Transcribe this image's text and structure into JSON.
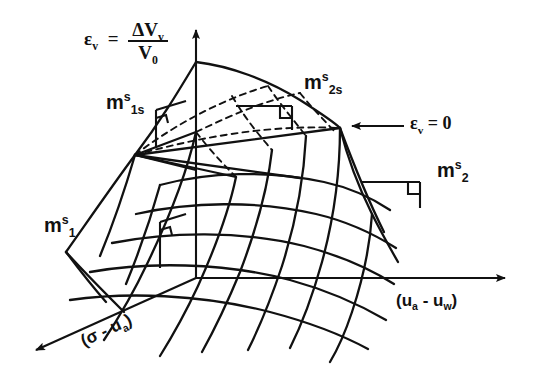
{
  "figure": {
    "type": "3d-surface-diagram",
    "background_color": "#ffffff",
    "line_color": "#111111"
  },
  "axes": {
    "vertical": {
      "name": "volumetric-strain-axis",
      "symbol": "ε",
      "symbol_sub": "v",
      "equals": "=",
      "numerator": "ΔV",
      "numerator_sub": "v",
      "denominator": "V",
      "denominator_sub": "0"
    },
    "horizontal": {
      "name": "matric-suction-axis",
      "label": "(u",
      "label_sub_a": "a",
      "label_minus": " - u",
      "label_sub_w": "w",
      "label_close": ")",
      "full": "(ua - uw)"
    },
    "depth": {
      "name": "net-normal-stress-axis",
      "label_open": "(σ - u",
      "label_sub": "a",
      "label_close": ")",
      "full": "(σ - ua)",
      "rotation_deg": -28
    }
  },
  "annotations": {
    "m1s": {
      "base": "m",
      "sup": "s",
      "sub": "1"
    },
    "m1ss": {
      "base": "m",
      "sup": "s",
      "sub": "1s"
    },
    "m2s": {
      "base": "m",
      "sup": "s",
      "sub": "2"
    },
    "m2ss": {
      "base": "m",
      "sup": "s",
      "sub": "2s"
    },
    "zero_strain": {
      "symbol": "ε",
      "symbol_sub": "v",
      "equals_zero": " = 0"
    }
  }
}
